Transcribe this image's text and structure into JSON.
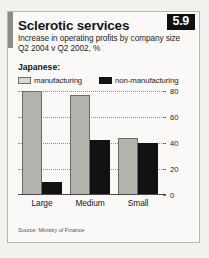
{
  "card": {
    "title": "Sclerotic services",
    "subtitle_line1": "Increase in operating profits by company size",
    "subtitle_line2": "Q2 2004 v Q2 2002, %",
    "badge": "5.9",
    "series_group_label": "Japanese:",
    "source": "Source: Ministry of Finance"
  },
  "colors": {
    "manufacturing": "#b3b2ad",
    "manufacturing_border": "#6e6d69",
    "non_manufacturing": "#121214",
    "badge_bg": "#111113",
    "badge_text": "#ffffff",
    "card_bg": "#faf9f7",
    "card_border": "#b9b7b2",
    "accent_bar": "#8d8b86",
    "gridline": "#8f8e8a",
    "axis": "#4a4a4c"
  },
  "legend": [
    {
      "label": "manufacturing",
      "swatch": "manufacturing"
    },
    {
      "label": "non-manufacturing",
      "swatch": "non-manufacturing"
    }
  ],
  "axis": {
    "ticks": [
      "0",
      "20",
      "40",
      "60",
      "80"
    ]
  },
  "chart_data": {
    "type": "bar",
    "title": "Sclerotic services",
    "subtitle": "Increase in operating profits by company size, Q2 2004 v Q2 2002, %",
    "xlabel": "",
    "ylabel": "%",
    "ylim": [
      0,
      80
    ],
    "yticks": [
      0,
      20,
      40,
      60,
      80
    ],
    "grid": true,
    "legend_position": "top-left",
    "categories": [
      "Large",
      "Medium",
      "Small"
    ],
    "series": [
      {
        "name": "manufacturing",
        "values": [
          80,
          77,
          44
        ]
      },
      {
        "name": "non-manufacturing",
        "values": [
          10,
          42,
          40
        ]
      }
    ],
    "annotations": [
      "Japanese:"
    ],
    "source": "Source: Ministry of Finance"
  }
}
